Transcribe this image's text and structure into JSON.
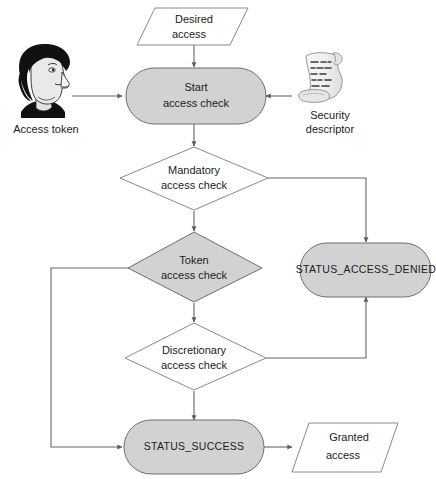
{
  "diagram": {
    "colors": {
      "shape_fill_gray": "#d2d2d2",
      "shape_fill_white": "#ffffff",
      "shape_stroke": "#6e6e6e",
      "connector_stroke": "#676767",
      "text": "#1b1b1b",
      "hair_dark": "#111111",
      "face_light": "#e9e9e9",
      "scroll_paper": "#f2f2f2"
    },
    "nodes": [
      {
        "id": "desired-access",
        "shape": "parallelogram",
        "fill": "white",
        "line1": "Desired",
        "line2": "access"
      },
      {
        "id": "start-access-check",
        "shape": "stadium",
        "fill": "gray",
        "line1": "Start",
        "line2": "access check"
      },
      {
        "id": "mandatory-access-check",
        "shape": "diamond",
        "fill": "white",
        "line1": "Mandatory",
        "line2": "access check"
      },
      {
        "id": "token-access-check",
        "shape": "diamond",
        "fill": "gray",
        "line1": "Token",
        "line2": "access check"
      },
      {
        "id": "discretionary-access-check",
        "shape": "diamond",
        "fill": "white",
        "line1": "Discretionary",
        "line2": "access check"
      },
      {
        "id": "status-access-denied",
        "shape": "stadium",
        "fill": "gray",
        "line1": "STATUS_ACCESS_DENIED",
        "line2": ""
      },
      {
        "id": "status-success",
        "shape": "stadium",
        "fill": "gray",
        "line1": "STATUS_SUCCESS",
        "line2": ""
      },
      {
        "id": "granted-access",
        "shape": "parallelogram",
        "fill": "white",
        "line1": "Granted",
        "line2": "access"
      }
    ],
    "icons": [
      {
        "id": "access-token",
        "glyph": "person-head-icon",
        "caption_line1": "Access token",
        "caption_line2": ""
      },
      {
        "id": "security-descriptor",
        "glyph": "scroll-icon",
        "caption_line1": "Security",
        "caption_line2": "descriptor"
      }
    ],
    "edges": [
      {
        "id": "desired-to-start",
        "from": "desired-access",
        "to": "start-access-check",
        "label": ""
      },
      {
        "id": "token-icon-to-start",
        "from": "access-token",
        "to": "start-access-check",
        "label": ""
      },
      {
        "id": "descriptor-to-start",
        "from": "security-descriptor",
        "to": "start-access-check",
        "label": ""
      },
      {
        "id": "start-to-mandatory",
        "from": "start-access-check",
        "to": "mandatory-access-check",
        "label": ""
      },
      {
        "id": "mandatory-to-denied",
        "from": "mandatory-access-check",
        "to": "status-access-denied",
        "label": ""
      },
      {
        "id": "mandatory-to-token",
        "from": "mandatory-access-check",
        "to": "token-access-check",
        "label": ""
      },
      {
        "id": "token-to-success",
        "from": "token-access-check",
        "to": "status-success",
        "label": ""
      },
      {
        "id": "token-to-discretionary",
        "from": "token-access-check",
        "to": "discretionary-access-check",
        "label": ""
      },
      {
        "id": "discretionary-to-denied",
        "from": "discretionary-access-check",
        "to": "status-access-denied",
        "label": ""
      },
      {
        "id": "discretionary-to-success",
        "from": "discretionary-access-check",
        "to": "status-success",
        "label": ""
      },
      {
        "id": "success-to-granted",
        "from": "status-success",
        "to": "granted-access",
        "label": ""
      }
    ]
  }
}
